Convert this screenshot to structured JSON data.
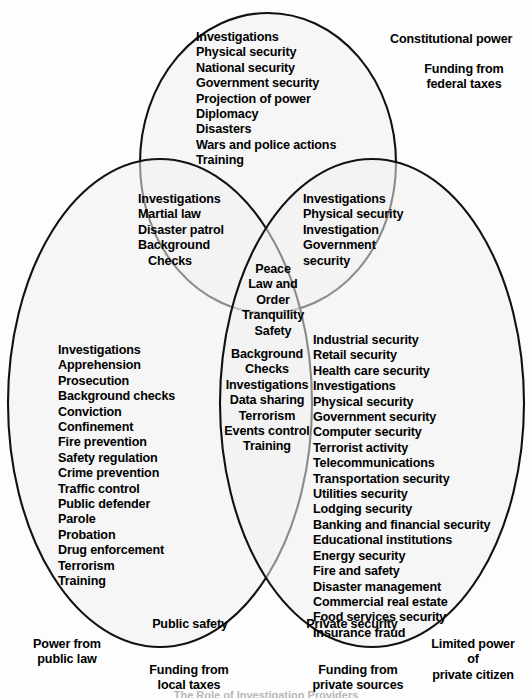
{
  "diagram": {
    "type": "venn-3-set",
    "sets": {
      "federal": {
        "name": "Federal / Constitutional",
        "items": [
          "Investigations",
          "Physical security",
          "National security",
          "Government security",
          "Projection of power",
          "Diplomacy",
          "Disasters",
          "Wars and police actions",
          "Training"
        ]
      },
      "local": {
        "name": "Public safety",
        "items": [
          "Investigations",
          "Apprehension",
          "Prosecution",
          "Background checks",
          "Conviction",
          "Confinement",
          "Fire prevention",
          "Safety regulation",
          "Crime prevention",
          "Traffic control",
          "Public defender",
          "Parole",
          "Probation",
          "Drug enforcement",
          "Terrorism",
          "Training"
        ]
      },
      "private": {
        "name": "Private security",
        "items": [
          "Industrial security",
          "Retail security",
          "Health care security",
          "Investigations",
          "Physical security",
          "Government security",
          "Computer security",
          "Terrorist activity",
          "Telecommunications",
          "Transportation security",
          "Utilities security",
          "Lodging security",
          "Banking and financial security",
          "Educational institutions",
          "Energy security",
          "Fire and safety",
          "Disaster management",
          "Commercial real estate",
          "Food services security",
          "Insurance fraud"
        ]
      }
    },
    "intersections": {
      "federal_local": {
        "name": "Federal and public safety overlap",
        "items": [
          "Investigations",
          "Martial law",
          "Disaster patrol",
          "Background",
          "   Checks"
        ]
      },
      "federal_private": {
        "name": "Federal and private overlap",
        "items": [
          "Investigations",
          "Physical security",
          "Investigation",
          "Government",
          "security"
        ]
      },
      "local_private": {
        "name": "Public safety and private overlap",
        "items": [
          "Background",
          "Checks",
          "Investigations",
          "Data sharing",
          "Terrorism",
          "Events control",
          "Training"
        ]
      },
      "core": {
        "name": "All three overlap",
        "items": [
          "Peace",
          "Law and",
          "Order",
          "Tranquility",
          "Safety"
        ]
      }
    },
    "outside_labels": {
      "constitutional_power": "Constitutional power",
      "federal_funding": "Funding from\nfederal taxes",
      "public_safety": "Public safety",
      "power_from_public_law": "Power from\npublic law",
      "local_funding": "Funding from\nlocal taxes",
      "private_security": "Private security",
      "private_funding": "Funding from\nprivate sources",
      "limited_power": "Limited power\nof\nprivate citizen"
    },
    "caption": "The Role of Investigation Providers"
  }
}
